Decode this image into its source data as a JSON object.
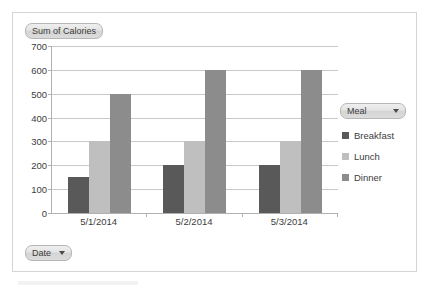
{
  "chart_data": {
    "type": "bar",
    "title": "Sum of Calories",
    "xlabel": "Date",
    "ylabel": "",
    "categories": [
      "5/1/2014",
      "5/2/2014",
      "5/3/2014"
    ],
    "series": [
      {
        "name": "Breakfast",
        "values": [
          150,
          200,
          200
        ],
        "color": "#595959"
      },
      {
        "name": "Lunch",
        "values": [
          300,
          300,
          300
        ],
        "color": "#bfbfbf"
      },
      {
        "name": "Dinner",
        "values": [
          500,
          600,
          600
        ],
        "color": "#8c8c8c"
      }
    ],
    "ylim": [
      0,
      700
    ],
    "ytick_labels": [
      "700",
      "600",
      "500",
      "400",
      "300",
      "200",
      "100",
      "0"
    ],
    "ytick_values": [
      700,
      600,
      500,
      400,
      300,
      200,
      100,
      0
    ],
    "grid": true,
    "legend_position": "right"
  },
  "value_field_button": {
    "label": "Sum of Calories"
  },
  "date_field_button": {
    "label": "Date",
    "arrow_icon": "chevron-down-icon"
  },
  "legend": {
    "field_button_label": "Meal",
    "field_button_arrow_icon": "chevron-down-icon",
    "items": [
      {
        "label": "Breakfast",
        "color": "#595959"
      },
      {
        "label": "Lunch",
        "color": "#bfbfbf"
      },
      {
        "label": "Dinner",
        "color": "#8c8c8c"
      }
    ]
  }
}
